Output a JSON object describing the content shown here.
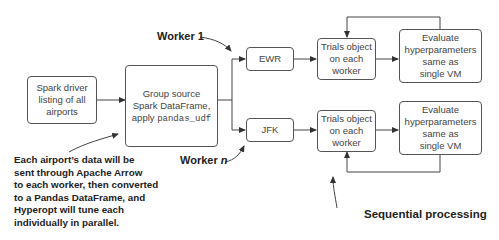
{
  "diagram": {
    "nodes": {
      "spark_driver": {
        "lines": [
          "Spark driver",
          "listing of all",
          "airports"
        ]
      },
      "group_source": {
        "lines": [
          "Group source",
          "Spark DataFrame,",
          "apply "
        ],
        "code": "pandas_udf"
      },
      "ewr": {
        "label": "EWR"
      },
      "jfk": {
        "label": "JFK"
      },
      "trials_top": {
        "lines": [
          "Trials object",
          "on each",
          "worker"
        ]
      },
      "trials_bottom": {
        "lines": [
          "Trials object",
          "on each",
          "worker"
        ]
      },
      "evaluate_top": {
        "lines": [
          "Evaluate",
          "hyperparameters",
          "same as",
          "single VM"
        ]
      },
      "evaluate_bottom": {
        "lines": [
          "Evaluate",
          "hyperparameters",
          "same as",
          "single VM"
        ]
      }
    },
    "annotations": {
      "worker_1": "Worker 1",
      "worker_n_prefix": "Worker ",
      "worker_n_var": "n",
      "arrow_note": [
        "Each airport’s data will be",
        "sent through Apache Arrow",
        "to each worker, then converted",
        "to a Pandas DataFrame, and",
        "Hyperopt will tune each",
        "individually in parallel."
      ],
      "sequential": "Sequential processing"
    },
    "colors": {
      "line": "#444444",
      "border": "#555555",
      "text": "#222222"
    }
  }
}
